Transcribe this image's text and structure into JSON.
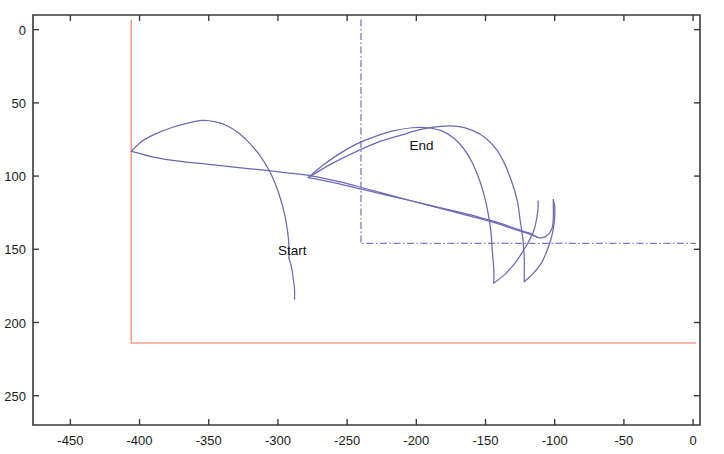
{
  "chart_data": {
    "type": "line",
    "title": "",
    "xlabel": "",
    "ylabel": "",
    "xlim": [
      -477,
      5
    ],
    "ylim": [
      270,
      -10
    ],
    "y_axis_inverted": true,
    "grid": false,
    "legend": null,
    "background_color": "#ffffff",
    "axis_color": "#3a3a3a",
    "xticks": [
      -450,
      -400,
      -350,
      -300,
      -250,
      -200,
      -150,
      -100,
      -50,
      0
    ],
    "xtick_labels": [
      "-450",
      "-400",
      "-350",
      "-300",
      "-250",
      "-200",
      "-150",
      "-100",
      "-50",
      "0"
    ],
    "yticks": [
      0,
      50,
      100,
      150,
      200,
      250
    ],
    "ytick_labels": [
      "0",
      "50",
      "100",
      "150",
      "200",
      "250"
    ],
    "annotations": [
      {
        "text": "Start",
        "x": -300,
        "y": 154
      },
      {
        "text": "End",
        "x": -205,
        "y": 82
      }
    ],
    "series": [
      {
        "name": "trajectory-upper-arc",
        "color": "#6a6ab4",
        "style": "solid",
        "points": [
          [
            -406,
            83
          ],
          [
            -398,
            76
          ],
          [
            -388,
            71
          ],
          [
            -377,
            67
          ],
          [
            -366,
            64
          ],
          [
            -355,
            62
          ],
          [
            -345,
            63
          ],
          [
            -336,
            66
          ],
          [
            -328,
            71
          ],
          [
            -320,
            78
          ],
          [
            -313,
            86
          ],
          [
            -307,
            95
          ],
          [
            -302,
            105
          ],
          [
            -298,
            116
          ],
          [
            -295,
            127
          ],
          [
            -293,
            138
          ],
          [
            -292,
            148
          ],
          [
            -292,
            156
          ]
        ]
      },
      {
        "name": "trajectory-lower-tail-to-start",
        "color": "#6a6ab4",
        "style": "solid",
        "points": [
          [
            -292,
            156
          ],
          [
            -290,
            163
          ],
          [
            -289,
            170
          ],
          [
            -288,
            177
          ],
          [
            -288,
            184
          ]
        ]
      },
      {
        "name": "trajectory-near-flat-long",
        "color": "#6a6ab4",
        "style": "solid",
        "points": [
          [
            -406,
            83
          ],
          [
            -390,
            87
          ],
          [
            -370,
            90
          ],
          [
            -350,
            92
          ],
          [
            -330,
            94
          ],
          [
            -310,
            96
          ],
          [
            -292,
            98
          ],
          [
            -275,
            100
          ],
          [
            -255,
            104
          ],
          [
            -235,
            109
          ],
          [
            -215,
            114
          ],
          [
            -195,
            119
          ],
          [
            -175,
            124
          ],
          [
            -158,
            128
          ],
          [
            -143,
            132
          ],
          [
            -130,
            136
          ],
          [
            -120,
            139
          ],
          [
            -112,
            142
          ]
        ]
      },
      {
        "name": "trajectory-second-arc",
        "color": "#6a6ab4",
        "style": "solid",
        "points": [
          [
            -278,
            101
          ],
          [
            -268,
            93
          ],
          [
            -256,
            85
          ],
          [
            -243,
            78
          ],
          [
            -230,
            73
          ],
          [
            -216,
            69
          ],
          [
            -203,
            67
          ],
          [
            -192,
            67
          ],
          [
            -182,
            69
          ],
          [
            -173,
            74
          ],
          [
            -166,
            81
          ],
          [
            -160,
            90
          ],
          [
            -155,
            101
          ],
          [
            -151,
            113
          ],
          [
            -148,
            126
          ],
          [
            -146,
            139
          ],
          [
            -145,
            152
          ],
          [
            -144,
            164
          ],
          [
            -144,
            173
          ]
        ]
      },
      {
        "name": "trajectory-third-arc",
        "color": "#6a6ab4",
        "style": "solid",
        "points": [
          [
            -278,
            101
          ],
          [
            -262,
            92
          ],
          [
            -245,
            84
          ],
          [
            -228,
            77
          ],
          [
            -211,
            72
          ],
          [
            -196,
            68
          ],
          [
            -182,
            66
          ],
          [
            -170,
            66
          ],
          [
            -159,
            69
          ],
          [
            -150,
            74
          ],
          [
            -142,
            82
          ],
          [
            -136,
            92
          ],
          [
            -131,
            104
          ],
          [
            -127,
            117
          ],
          [
            -125,
            130
          ],
          [
            -123,
            143
          ],
          [
            -122,
            156
          ],
          [
            -122,
            166
          ],
          [
            -122,
            172
          ]
        ]
      },
      {
        "name": "trajectory-return-lower-left",
        "color": "#6a6ab4",
        "style": "solid",
        "points": [
          [
            -144,
            173
          ],
          [
            -137,
            168
          ],
          [
            -130,
            161
          ],
          [
            -124,
            153
          ],
          [
            -119,
            145
          ],
          [
            -115,
            137
          ],
          [
            -113,
            129
          ],
          [
            -112,
            122
          ],
          [
            -112,
            117
          ]
        ]
      },
      {
        "name": "trajectory-return-lower-right",
        "color": "#6a6ab4",
        "style": "solid",
        "points": [
          [
            -122,
            172
          ],
          [
            -116,
            167
          ],
          [
            -110,
            160
          ],
          [
            -106,
            152
          ],
          [
            -103,
            144
          ],
          [
            -101,
            136
          ],
          [
            -100,
            128
          ],
          [
            -100,
            121
          ],
          [
            -101,
            116
          ]
        ]
      },
      {
        "name": "trajectory-inner-link",
        "color": "#6a6ab4",
        "style": "solid",
        "points": [
          [
            -278,
            101
          ],
          [
            -262,
            104
          ],
          [
            -244,
            108
          ],
          [
            -226,
            112
          ],
          [
            -208,
            116
          ],
          [
            -190,
            120
          ],
          [
            -172,
            124
          ],
          [
            -155,
            128
          ],
          [
            -140,
            132
          ],
          [
            -128,
            136
          ],
          [
            -118,
            139
          ],
          [
            -112,
            142
          ],
          [
            -106,
            141
          ],
          [
            -102,
            136
          ],
          [
            -101,
            128
          ],
          [
            -101,
            120
          ],
          [
            -101,
            116
          ]
        ]
      }
    ],
    "boundaries": [
      {
        "name": "outer-boundary-red",
        "color": "#f4a086",
        "style": "solid",
        "points": [
          [
            -406,
            -7
          ],
          [
            -406,
            214
          ],
          [
            2,
            214
          ]
        ]
      },
      {
        "name": "inner-boundary-blue-dashdot",
        "color": "#7b7bc4",
        "style": "dash-dot",
        "points": [
          [
            -240,
            -7
          ],
          [
            -240,
            146
          ],
          [
            2,
            146
          ]
        ]
      }
    ]
  },
  "annotations": {
    "start_label": "Start",
    "end_label": "End"
  },
  "axes": {
    "x_tick_labels": [
      "-450",
      "-400",
      "-350",
      "-300",
      "-250",
      "-200",
      "-150",
      "-100",
      "-50",
      "0"
    ],
    "y_tick_labels": [
      "0",
      "50",
      "100",
      "150",
      "200",
      "250"
    ]
  }
}
